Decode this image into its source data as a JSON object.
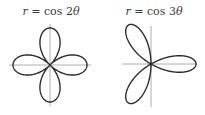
{
  "chart_data": [
    {
      "type": "line",
      "subtype": "polar-rose",
      "title": "r = cos 2θ",
      "title_parts": {
        "lhs": "r",
        "eq": " = cos 2",
        "theta": "θ"
      },
      "equation": {
        "function": "cos",
        "n": 2
      },
      "petals": 4,
      "petal_angles_deg": [
        0,
        90,
        180,
        270
      ],
      "xlabel": "",
      "ylabel": "",
      "axes": {
        "xlim": [
          -1.1,
          1.1
        ],
        "ylim": [
          -1.1,
          1.1
        ],
        "grid": false,
        "ticks": false
      },
      "legend": null,
      "render": {
        "offset_x": 0,
        "center": [
          50,
          65
        ],
        "radius_px": 37,
        "axis_half_x": 41,
        "axis_half_y": 41
      }
    },
    {
      "type": "line",
      "subtype": "polar-rose",
      "title": "r = cos 3θ",
      "title_parts": {
        "lhs": "r",
        "eq": " = cos 3",
        "theta": "θ"
      },
      "equation": {
        "function": "cos",
        "n": 3
      },
      "petals": 3,
      "petal_angles_deg": [
        0,
        120,
        240
      ],
      "xlabel": "",
      "ylabel": "",
      "axes": {
        "xlim": [
          -0.65,
          1.05
        ],
        "ylim": [
          -1.0,
          1.0
        ],
        "grid": false,
        "ticks": false
      },
      "legend": null,
      "render": {
        "offset_x": 103,
        "center": [
          151,
          64
        ],
        "radius_px": 45,
        "axis_left": 29,
        "axis_right": 46,
        "axis_up": 38,
        "axis_down": 43
      }
    }
  ],
  "colors": {
    "curve": "#2e2e2e",
    "axis": "#9a9a9a",
    "title": "#3a3a3a",
    "background": "#ffffff"
  }
}
